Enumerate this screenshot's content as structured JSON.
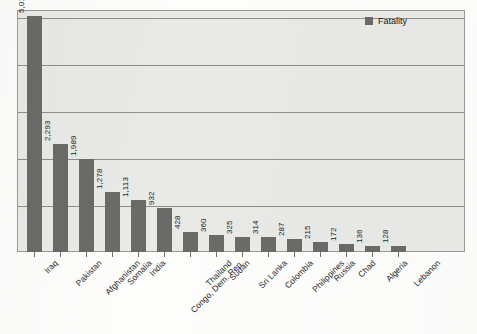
{
  "chart_data": {
    "type": "bar",
    "title": "",
    "xlabel": "",
    "ylabel": "",
    "ylim": [
      0,
      5150
    ],
    "grid": true,
    "gridlines": [
      1000,
      2000,
      3000,
      4000,
      5000
    ],
    "legend_position": "top-right",
    "orientation": "vertical",
    "value_label_rotation": "-90",
    "category_label_rotation": "-45",
    "bar_color": "#6a6a68",
    "plot_background": "#e9e9e7",
    "categories": [
      "Iraq",
      "Pakistan",
      "Afghanistan",
      "Somalia",
      "India",
      "Congo, Dem. Rep.",
      "Thailand",
      "Sudan",
      "Sri Lanka",
      "Colombia",
      "Philippines",
      "Russia",
      "Chad",
      "Algeria",
      "Lebanon"
    ],
    "series": [
      {
        "name": "Fatality",
        "values": [
          5016,
          2293,
          1989,
          1278,
          1113,
          932,
          428,
          360,
          325,
          314,
          287,
          215,
          172,
          136,
          128
        ]
      }
    ],
    "value_labels": [
      "5,016",
      "2,293",
      "1,989",
      "1,278",
      "1,113",
      "932",
      "428",
      "360",
      "325",
      "314",
      "287",
      "215",
      "172",
      "136",
      "128"
    ]
  },
  "legend": {
    "entries": [
      {
        "label": "Fatality",
        "color": "#6a6a68"
      }
    ]
  }
}
